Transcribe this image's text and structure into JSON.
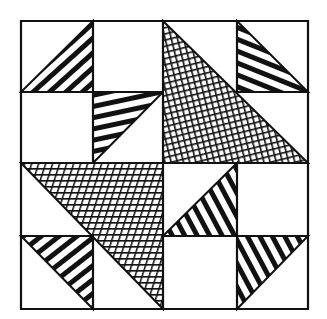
{
  "title": "Quilt block line drawing",
  "colors": {
    "ink": "#111111",
    "paper": "#ffffff"
  },
  "grid": {
    "x": [
      21,
      93,
      163,
      237,
      308
    ],
    "y": [
      21,
      92,
      163,
      236,
      309
    ]
  },
  "pieces": [
    {
      "id": "tl-small",
      "cell": "row0-col0",
      "fill": "stripes",
      "shape": "lower-right-triangle",
      "stripe_direction": "slash"
    },
    {
      "id": "r1c1-small",
      "cell": "row1-col1",
      "fill": "stripes",
      "shape": "upper-left-triangle",
      "stripe_direction": "near-horizontal"
    },
    {
      "id": "upper-right-large",
      "cell": "rows0-1-cols2-3",
      "fill": "crosshatch",
      "shape": "lower-left-triangle"
    },
    {
      "id": "tr-small",
      "cell": "row0-col3",
      "fill": "stripes",
      "shape": "lower-left-triangle",
      "stripe_direction": "shallow-backslash"
    },
    {
      "id": "lower-left-large",
      "cell": "rows2-3-cols0-1",
      "fill": "crosshatch",
      "shape": "upper-right-triangle"
    },
    {
      "id": "r2c2-small",
      "cell": "row2-col2",
      "fill": "stripes",
      "shape": "lower-right-triangle",
      "stripe_direction": "steep-backslash"
    },
    {
      "id": "bl-small",
      "cell": "row3-col0",
      "fill": "stripes",
      "shape": "upper-right-triangle",
      "stripe_direction": "slash"
    },
    {
      "id": "br-small",
      "cell": "row3-col3",
      "fill": "stripes",
      "shape": "upper-left-triangle",
      "stripe_direction": "steep-backslash"
    }
  ]
}
